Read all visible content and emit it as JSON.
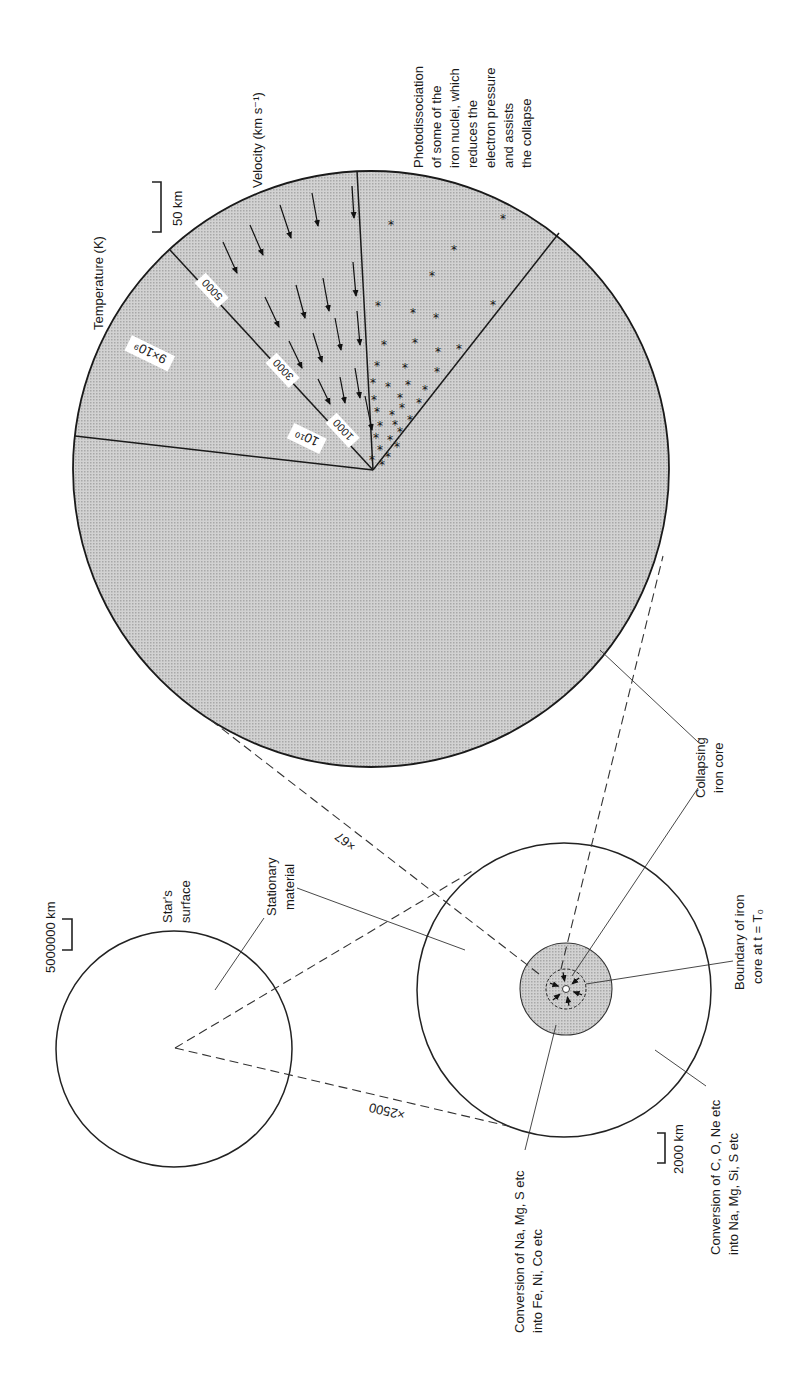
{
  "figure": {
    "fill_color": "#c9c9c9",
    "line_color": "#1a1a1a"
  },
  "collapsing_core_view": {
    "scale_bar": "50 km",
    "sectors": {
      "temperature": {
        "title": "Temperature (K)",
        "values": [
          "9×10⁹",
          "10¹⁰"
        ]
      },
      "velocity": {
        "title": "Velocity (km s⁻¹)",
        "contours": [
          "5000",
          "3000",
          "1000"
        ],
        "direction": "inward"
      },
      "photodissociation": {
        "lines": [
          "Photodissociation",
          "of some of the",
          "iron nuclei, which",
          "reduces the",
          "electron pressure",
          "and assists",
          "the collapse"
        ]
      }
    },
    "label": [
      "Collapsing",
      "iron core"
    ]
  },
  "magnifications": {
    "star_to_core": "×2500",
    "core_to_inner": "×67"
  },
  "star_view": {
    "scale_bar": "5000000 km",
    "surface_label": [
      "Star's",
      "surface"
    ],
    "stationary_label": [
      "Stationary",
      "material"
    ]
  },
  "core_view": {
    "scale_bar": "2000 km",
    "boundary_label": [
      "Boundary of iron",
      "core at t = T₀"
    ],
    "outer_conversion_label": [
      "Conversion of C, O, Ne etc",
      "into Na, Mg, Si, S etc"
    ],
    "inner_conversion_label": [
      "Conversion of Na, Mg, S etc",
      "into Fe, Ni, Co etc"
    ]
  }
}
